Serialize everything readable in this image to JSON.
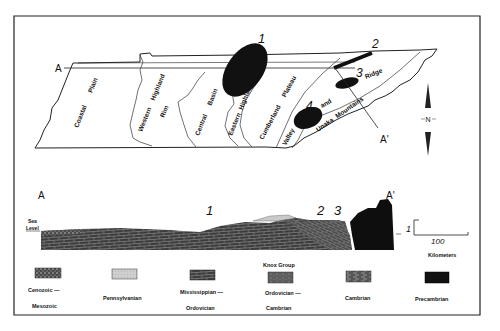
{
  "map": {
    "section_start": "A",
    "section_end": "A'",
    "regions": [
      {
        "label": "Coastal Plain"
      },
      {
        "label": "Western Highland Rim"
      },
      {
        "label": "Central Basin"
      },
      {
        "label": "Eastern Highland Rim"
      },
      {
        "label": "Cumberland Plateau"
      },
      {
        "label": "Valley and Ridge"
      },
      {
        "label": "Unaka Mountains"
      }
    ],
    "region_words": {
      "coastal": "Coastal",
      "plain": "Plain",
      "western": "Western",
      "highland1": "Highland",
      "rim1": "Rim",
      "central": "Central",
      "basin": "Basin",
      "eastern": "Eastern",
      "highland2": "Highland",
      "rim2": "Rim",
      "cumberland": "Cumberland",
      "plateau": "Plateau",
      "valley": "Valley",
      "and": "and",
      "ridge": "Ridge",
      "unaka": "Unaka",
      "mountains": "Mountains"
    },
    "sites": [
      {
        "number": "1"
      },
      {
        "number": "2"
      },
      {
        "number": "3"
      },
      {
        "number": "4"
      }
    ],
    "north_arrow": "N"
  },
  "cross_section": {
    "start_label": "A",
    "end_label": "A'",
    "sea_level_line1": "Sea",
    "sea_level_line2": "Level",
    "site_labels": [
      "1",
      "2",
      "3"
    ],
    "vertical_scale": "1",
    "horizontal_scale": "100",
    "scale_unit": "Kilometers"
  },
  "legend": {
    "items": [
      {
        "line1": "Cenozoic —",
        "line2": "Mesozoic",
        "pattern": "speckled",
        "color": "#5a5a5a"
      },
      {
        "line1": "Pennsylvanian",
        "line2": "",
        "pattern": "light-stipple",
        "color": "#c8c8c8"
      },
      {
        "line1": "Mississippian —",
        "line2": "Ordovician",
        "pattern": "brick",
        "color": "#3a3a3a"
      },
      {
        "line1": "Ordovician —",
        "line2": "Cambrian",
        "header": "Knox  Group",
        "pattern": "dense-brick",
        "color": "#4a4a4a"
      },
      {
        "line1": "Cambrian",
        "line2": "",
        "pattern": "dashed-brick",
        "color": "#555555"
      },
      {
        "line1": "Precambrian",
        "line2": "",
        "pattern": "solid",
        "color": "#111111"
      }
    ]
  }
}
